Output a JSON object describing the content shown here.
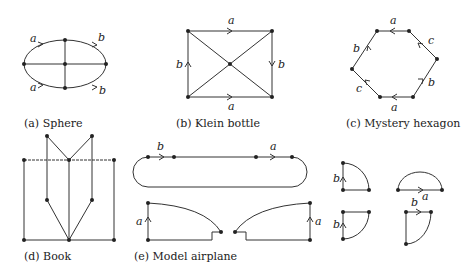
{
  "figures": [
    {
      "id": "a",
      "caption": "(a) Sphere",
      "edge_labels": [
        "a",
        "b",
        "a",
        "b"
      ]
    },
    {
      "id": "b",
      "caption": "(b) Klein bottle",
      "edge_labels": [
        "a",
        "b",
        "b",
        "a"
      ]
    },
    {
      "id": "c",
      "caption": "(c) Mystery hexagon",
      "edge_labels": [
        "a",
        "c",
        "b",
        "b",
        "c",
        "a"
      ]
    },
    {
      "id": "d",
      "caption": "(d) Book"
    },
    {
      "id": "e",
      "caption": "(e) Model airplane",
      "edge_labels": [
        "b",
        "a",
        "a",
        "a",
        "b",
        "b",
        "a",
        "b"
      ]
    }
  ],
  "colors": {
    "line": "#333333",
    "text": "#222222",
    "background": "#ffffff"
  }
}
